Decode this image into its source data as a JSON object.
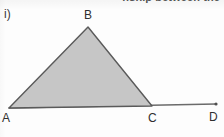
{
  "page": {
    "background_color": "#fdfdfd",
    "clipped_heading_text": "nship between the",
    "part_label": "i)"
  },
  "figure": {
    "name": "triangle-abc-with-extended-base",
    "fill_color": "#c6c6c6",
    "stroke_color": "#5a5a5a",
    "baseline_color": "#6b6b6b",
    "vertices": [
      {
        "id": "A",
        "label": "A",
        "x": 9,
        "y": 108
      },
      {
        "id": "B",
        "label": "B",
        "x": 88,
        "y": 27
      },
      {
        "id": "C",
        "label": "C",
        "x": 152,
        "y": 106
      },
      {
        "id": "D",
        "label": "D",
        "x": 216,
        "y": 104
      }
    ],
    "triangle_points": "9,108 88,27 152,106",
    "baseline_points": "9,108 216,104",
    "endpoint_marker": {
      "x": 216,
      "y": 104,
      "r": 1.6
    }
  }
}
